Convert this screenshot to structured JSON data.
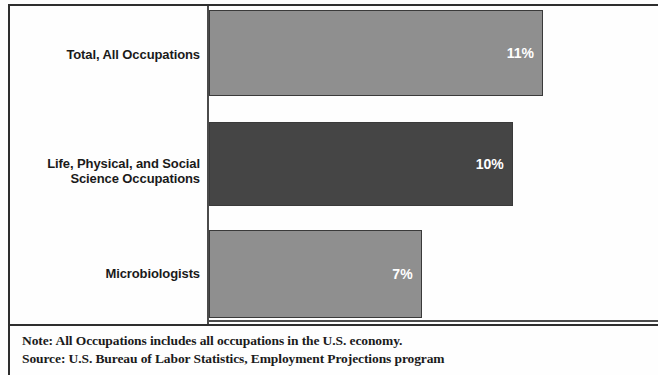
{
  "chart_data": {
    "type": "bar",
    "orientation": "horizontal",
    "title": "",
    "xlabel": "",
    "ylabel": "",
    "categories": [
      "Total, All Occupations",
      "Life, Physical, and Social Science Occupations",
      "Microbiologists"
    ],
    "values": [
      11,
      10,
      7
    ],
    "value_labels": [
      "11%",
      "10%",
      "7%"
    ],
    "xlim": [
      0,
      14.85
    ],
    "grid": false,
    "legend": null,
    "series": [
      {
        "name": "Percent change, projected",
        "values": [
          11,
          10,
          7
        ]
      }
    ],
    "bar_colors": [
      "#8f8f8f",
      "#454545",
      "#8f8f8f"
    ],
    "bar_border_color": "#3a3a3a",
    "value_label_color": "#ffffff",
    "axis_color": "#4b4b4b"
  },
  "bars": [
    {
      "label_line1": "Total, All Occupations",
      "label_line2": "",
      "value_label": "11%"
    },
    {
      "label_line1": "Life, Physical, and Social",
      "label_line2": "Science Occupations",
      "value_label": "10%"
    },
    {
      "label_line1": "Microbiologists",
      "label_line2": "",
      "value_label": "7%"
    }
  ],
  "footer": {
    "note": "Note: All Occupations includes all occupations in the U.S. economy.",
    "source": "Source: U.S. Bureau of Labor Statistics, Employment Projections program"
  }
}
